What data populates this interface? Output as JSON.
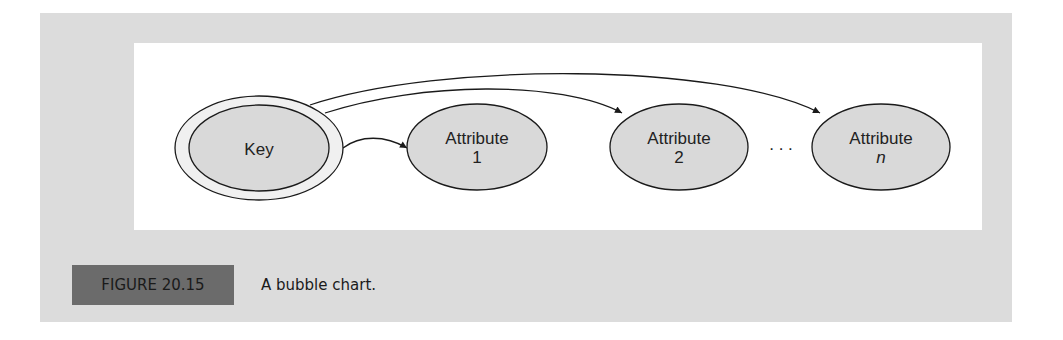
{
  "figure": {
    "label": "FIGURE 20.15",
    "caption": "A bubble chart."
  },
  "diagram": {
    "type": "bubble-chart",
    "nodes": [
      {
        "id": "key",
        "line1": "Key",
        "line2": "",
        "style": "double-ellipse"
      },
      {
        "id": "attr1",
        "line1": "Attribute",
        "line2": "1",
        "style": "ellipse"
      },
      {
        "id": "attr2",
        "line1": "Attribute",
        "line2": "2",
        "style": "ellipse"
      },
      {
        "id": "attrn",
        "line1": "Attribute",
        "line2": "n",
        "style": "ellipse",
        "line2_italic": true
      }
    ],
    "ellipsis": ". . .",
    "edges": [
      {
        "from": "key",
        "to": "attr1"
      },
      {
        "from": "key",
        "to": "attr2"
      },
      {
        "from": "key",
        "to": "attrn"
      }
    ],
    "colors": {
      "node_fill": "#d9d9d9",
      "stroke": "#1a1a1a",
      "panel": "#dcdcdc",
      "caption_box": "#6b6b6b"
    }
  }
}
